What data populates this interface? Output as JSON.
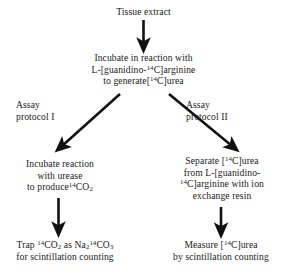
{
  "diagram": {
    "type": "flowchart",
    "title_node": "Tissue extract",
    "nodes": {
      "tissue_extract": {
        "lines": [
          "Tissue extract"
        ]
      },
      "incubate_reaction": {
        "lines": [
          "Incubate in reaction with",
          "L-[guanidino-@SUP14@C]arginine",
          "to generate[@SUP14@C]urea"
        ]
      },
      "assay_protocol_1": {
        "lines": [
          "Assay",
          "protocol I"
        ]
      },
      "assay_protocol_2": {
        "lines": [
          "Assay",
          "protocol II"
        ]
      },
      "urease_step": {
        "lines": [
          "Incubate reaction",
          "with urease",
          "to produce@SUP14@CO@SUB2@"
        ]
      },
      "separate_step": {
        "lines": [
          "Separate [@SUP14@C]urea",
          "from L-[guanidino-",
          "@SUP14@C]arginine with ion",
          "exchange resin"
        ]
      },
      "trap_step": {
        "lines": [
          "Trap @SUP14@CO@SUB2@ as Na@SUB2@@SUP14@CO@SUB3@",
          "for scintillation counting"
        ]
      },
      "measure_step": {
        "lines": [
          "Measure [@SUP14@C]urea",
          "by scintillation counting"
        ]
      }
    },
    "arrows": [
      {
        "name": "arrow-tissue-to-incubate",
        "kind": "vertical-down"
      },
      {
        "name": "arrow-incubate-to-urease",
        "kind": "diagonal-down-left"
      },
      {
        "name": "arrow-incubate-to-separate",
        "kind": "diagonal-down-right"
      },
      {
        "name": "arrow-urease-to-trap",
        "kind": "vertical-down"
      },
      {
        "name": "arrow-separate-to-measure",
        "kind": "vertical-down"
      }
    ],
    "colors": {
      "background": "#ffffff",
      "text": "#1a1a1a",
      "arrow": "#111111"
    }
  }
}
